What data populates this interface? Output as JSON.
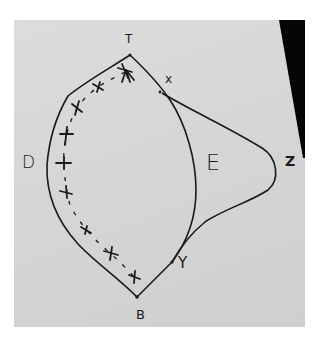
{
  "diagram": {
    "kind": "hand-drawn sketch on paper",
    "labels": {
      "top": "T",
      "bottom": "B",
      "left": "D",
      "center_right": "E",
      "far_right": "Z",
      "upper_point": "x",
      "lower_point": "Y"
    },
    "paths": [
      {
        "name": "outer-left-curve",
        "from": "T",
        "to": "B",
        "via": "D"
      },
      {
        "name": "inner-right-curve",
        "from": "T",
        "to": "Y",
        "via": "E"
      },
      {
        "name": "outer-right-curve",
        "from": "x",
        "to": "Y",
        "via": "Z"
      },
      {
        "name": "lower-segment",
        "from": "Y",
        "to": "B"
      },
      {
        "name": "dashed-crossed-path",
        "from": "T",
        "to": "B",
        "style": "dashed with x markers"
      }
    ],
    "colors": {
      "paper": "#d6d6d6",
      "ink": "#1a1a1a",
      "shadow": "#000000"
    }
  }
}
